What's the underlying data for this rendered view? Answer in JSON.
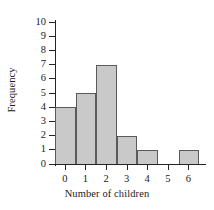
{
  "chart_data": {
    "type": "bar",
    "title": "",
    "subtitle": "",
    "xlabel": "Number of children",
    "ylabel": "Frequency",
    "categories": [
      "0",
      "1",
      "2",
      "3",
      "4",
      "5",
      "6"
    ],
    "values": [
      4,
      5,
      7,
      2,
      1,
      0,
      1
    ],
    "series": [
      {
        "name": "Frequency",
        "values": [
          4,
          5,
          7,
          2,
          1,
          0,
          1
        ]
      }
    ],
    "xlim": [
      -0.5,
      6.5
    ],
    "ylim": [
      0,
      10
    ],
    "y_ticks": [
      0,
      1,
      2,
      3,
      4,
      5,
      6,
      7,
      8,
      9,
      10
    ],
    "y_tick_labels": [
      "0",
      "1",
      "2",
      "3",
      "4",
      "5",
      "6",
      "7",
      "8",
      "9",
      "10"
    ],
    "x_ticks": [
      0,
      1,
      2,
      3,
      4,
      5,
      6
    ],
    "x_tick_labels": [
      "0",
      "1",
      "2",
      "3",
      "4",
      "5",
      "6"
    ],
    "grid": false,
    "legend": null,
    "annotations": [],
    "style": {
      "bar_fill": "#c9c9c9",
      "bar_edge": "#5a5a5a",
      "axis_color": "#242424",
      "text_color": "#1a1a1a",
      "background": "#ffffff"
    }
  }
}
